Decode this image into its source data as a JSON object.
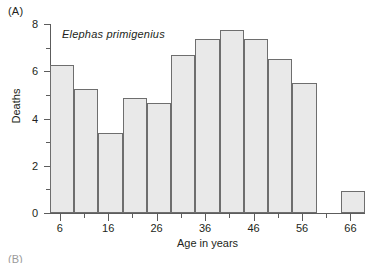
{
  "panel": {
    "label": "(A)",
    "next_label": "(B)"
  },
  "chart_data": {
    "type": "bar",
    "title": "Elephas primigenius",
    "xlabel": "Age in years",
    "ylabel": "Deaths",
    "xlim": [
      4,
      69
    ],
    "ylim": [
      0,
      8
    ],
    "bin_width": 5,
    "grid": false,
    "legend": null,
    "y_major_ticks": [
      0,
      2,
      4,
      6,
      8
    ],
    "y_minor_ticks": [
      1,
      3,
      5,
      7
    ],
    "y_tick_labels": [
      "0",
      "2",
      "4",
      "6",
      "8"
    ],
    "x_major_ticks": [
      6,
      16,
      26,
      36,
      46,
      56,
      66
    ],
    "x_minor_ticks": [
      11,
      21,
      31,
      41,
      51,
      61
    ],
    "x_tick_labels": [
      "6",
      "16",
      "26",
      "36",
      "46",
      "56",
      "66"
    ],
    "bin_starts": [
      4,
      9,
      14,
      19,
      24,
      29,
      34,
      39,
      44,
      49,
      54,
      59,
      64
    ],
    "bin_ends": [
      9,
      14,
      19,
      24,
      29,
      34,
      39,
      44,
      49,
      54,
      59,
      64,
      69
    ],
    "categories": [
      "4-9",
      "9-14",
      "14-19",
      "19-24",
      "24-29",
      "29-34",
      "34-39",
      "39-44",
      "44-49",
      "49-54",
      "54-59",
      "59-64",
      "64-69"
    ],
    "values": [
      6.25,
      5.25,
      3.4,
      4.85,
      4.65,
      6.7,
      7.35,
      7.75,
      7.35,
      6.5,
      5.5,
      0,
      0.95
    ],
    "bar_fill": "#e9e9e9",
    "bar_stroke": "#6e6e6e",
    "axis_color": "#5c5c5c",
    "background": "#ffffff"
  }
}
